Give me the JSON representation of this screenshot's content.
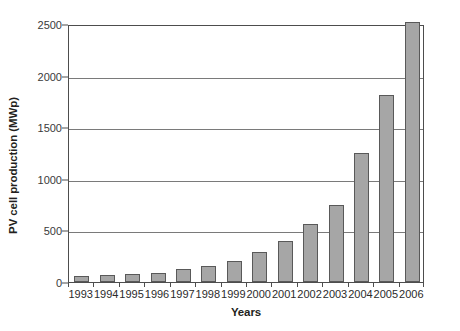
{
  "chart_data": {
    "type": "bar",
    "title": "",
    "xlabel": "Years",
    "ylabel": "PV cell production (MWp)",
    "categories": [
      "1993",
      "1994",
      "1995",
      "1996",
      "1997",
      "1998",
      "1999",
      "2000",
      "2001",
      "2002",
      "2003",
      "2004",
      "2005",
      "2006"
    ],
    "values": [
      60,
      70,
      78,
      89,
      126,
      155,
      201,
      288,
      401,
      560,
      750,
      1250,
      1815,
      2520
    ],
    "ylim": [
      0,
      2500
    ],
    "yticks": [
      0,
      500,
      1000,
      1500,
      2000,
      2500
    ],
    "ytick_labels": [
      "0",
      "500",
      "1000",
      "1500",
      "2000",
      "2500"
    ],
    "grid": "horizontal",
    "legend": "none",
    "bar_color": "#a6a6a6",
    "bar_edge_color": "#595959",
    "gridline_color": "#7a7a7a",
    "axis_color": "#4d4d4d",
    "text_color": "#231f20",
    "background": "#ffffff"
  }
}
